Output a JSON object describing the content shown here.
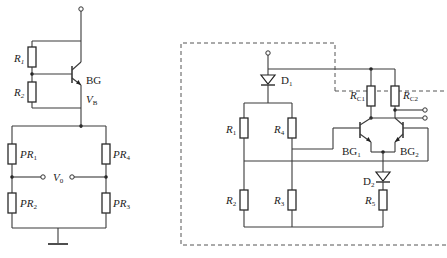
{
  "left_circuit": {
    "resistors": [
      {
        "id": "R1",
        "label": "R",
        "sub": "1"
      },
      {
        "id": "R2",
        "label": "R",
        "sub": "2"
      }
    ],
    "transistor": {
      "label": "BG"
    },
    "voltage_node": {
      "label": "V",
      "sub": "B"
    },
    "bridge": {
      "resistors": [
        {
          "id": "PR1",
          "label": "PR",
          "sub": "1"
        },
        {
          "id": "PR2",
          "label": "PR",
          "sub": "2"
        },
        {
          "id": "PR3",
          "label": "PR",
          "sub": "3"
        },
        {
          "id": "PR4",
          "label": "PR",
          "sub": "4"
        }
      ],
      "output": {
        "label": "V",
        "sub": "0"
      }
    }
  },
  "right_circuit": {
    "diodes": [
      {
        "id": "D1",
        "label": "D",
        "sub": "1"
      },
      {
        "id": "D2",
        "label": "D",
        "sub": "2"
      }
    ],
    "resistors": [
      {
        "id": "R1",
        "label": "R",
        "sub": "1"
      },
      {
        "id": "R2",
        "label": "R",
        "sub": "2"
      },
      {
        "id": "R3",
        "label": "R",
        "sub": "3"
      },
      {
        "id": "R4",
        "label": "R",
        "sub": "4"
      },
      {
        "id": "R5",
        "label": "R",
        "sub": "5"
      },
      {
        "id": "RC1",
        "label": "R",
        "sub": "C1"
      },
      {
        "id": "RC2",
        "label": "R",
        "sub": "C2"
      }
    ],
    "transistors": [
      {
        "id": "BG1",
        "label": "BG",
        "sub": "1"
      },
      {
        "id": "BG2",
        "label": "BG",
        "sub": "2"
      }
    ]
  }
}
